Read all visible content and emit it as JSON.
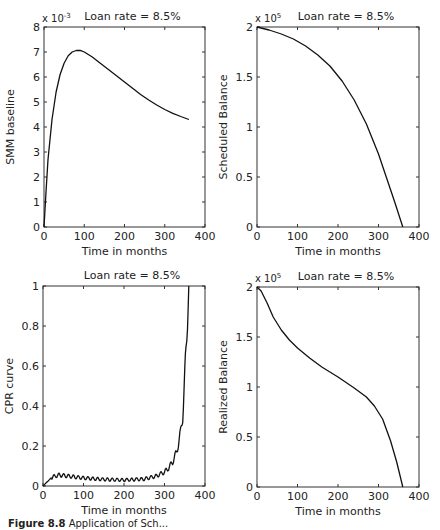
{
  "figure": {
    "caption_label": "Figure 8.8",
    "caption_text": "Application of Sch..."
  },
  "chart_data": [
    {
      "id": "smm",
      "type": "line",
      "title": "Loan rate = 8.5%",
      "xlabel": "Time in months",
      "ylabel": "SMM baseline",
      "y_multiplier": "x 10^-3",
      "xlim": [
        0,
        400
      ],
      "ylim": [
        0,
        8
      ],
      "xticks": [
        "0",
        "100",
        "200",
        "300",
        "400"
      ],
      "yticks": [
        "0",
        "1",
        "2",
        "3",
        "4",
        "5",
        "6",
        "7",
        "8"
      ],
      "grid": false,
      "x": [
        0,
        5,
        10,
        20,
        30,
        40,
        50,
        60,
        70,
        80,
        90,
        100,
        120,
        140,
        160,
        180,
        200,
        220,
        240,
        260,
        280,
        300,
        320,
        340,
        360
      ],
      "values": [
        0,
        1.4,
        2.7,
        4.3,
        5.4,
        6.1,
        6.55,
        6.85,
        7.0,
        7.06,
        7.07,
        7.0,
        6.8,
        6.55,
        6.3,
        6.05,
        5.8,
        5.55,
        5.3,
        5.08,
        4.88,
        4.7,
        4.55,
        4.42,
        4.3
      ]
    },
    {
      "id": "scheduled_balance",
      "type": "line",
      "title": "Loan rate = 8.5%",
      "xlabel": "Time in months",
      "ylabel": "Scheduled Balance",
      "y_multiplier": "x 10^5",
      "xlim": [
        0,
        400
      ],
      "ylim": [
        0,
        2
      ],
      "xticks": [
        "0",
        "100",
        "200",
        "300",
        "400"
      ],
      "yticks": [
        "0",
        "0.5",
        "1",
        "1.5",
        "2"
      ],
      "grid": false,
      "x": [
        0,
        30,
        60,
        90,
        120,
        150,
        180,
        210,
        240,
        270,
        300,
        320,
        340,
        360
      ],
      "values": [
        2.0,
        1.97,
        1.93,
        1.88,
        1.81,
        1.72,
        1.61,
        1.46,
        1.27,
        1.03,
        0.73,
        0.49,
        0.25,
        0.0
      ]
    },
    {
      "id": "cpr",
      "type": "line",
      "title": "Loan rate = 8.5%",
      "xlabel": "Time in months",
      "ylabel": "CPR curve",
      "xlim": [
        0,
        400
      ],
      "ylim": [
        0,
        1
      ],
      "xticks": [
        "0",
        "100",
        "200",
        "300",
        "400"
      ],
      "yticks": [
        "0",
        "0.2",
        "0.4",
        "0.6",
        "0.8",
        "1"
      ],
      "grid": false,
      "x": [
        0,
        10,
        20,
        30,
        40,
        60,
        80,
        100,
        150,
        200,
        250,
        280,
        300,
        310,
        320,
        330,
        340,
        345,
        350,
        355,
        360
      ],
      "values": [
        0,
        0.02,
        0.04,
        0.05,
        0.055,
        0.05,
        0.045,
        0.04,
        0.033,
        0.03,
        0.035,
        0.05,
        0.07,
        0.09,
        0.12,
        0.17,
        0.27,
        0.35,
        0.55,
        0.75,
        1.0
      ]
    },
    {
      "id": "realized_balance",
      "type": "line",
      "title": "Loan rate = 8.5%",
      "xlabel": "Time in months",
      "ylabel": "Realized Balance",
      "y_multiplier": "x 10^5",
      "xlim": [
        0,
        400
      ],
      "ylim": [
        0,
        2
      ],
      "xticks": [
        "0",
        "100",
        "200",
        "300",
        "400"
      ],
      "yticks": [
        "0",
        "0.5",
        "1",
        "1.5",
        "2"
      ],
      "grid": false,
      "x": [
        0,
        10,
        25,
        40,
        60,
        80,
        100,
        130,
        160,
        200,
        240,
        270,
        290,
        310,
        330,
        345,
        360
      ],
      "values": [
        2.0,
        1.96,
        1.84,
        1.7,
        1.57,
        1.47,
        1.39,
        1.29,
        1.2,
        1.1,
        0.99,
        0.9,
        0.81,
        0.68,
        0.46,
        0.25,
        0.0
      ]
    }
  ]
}
